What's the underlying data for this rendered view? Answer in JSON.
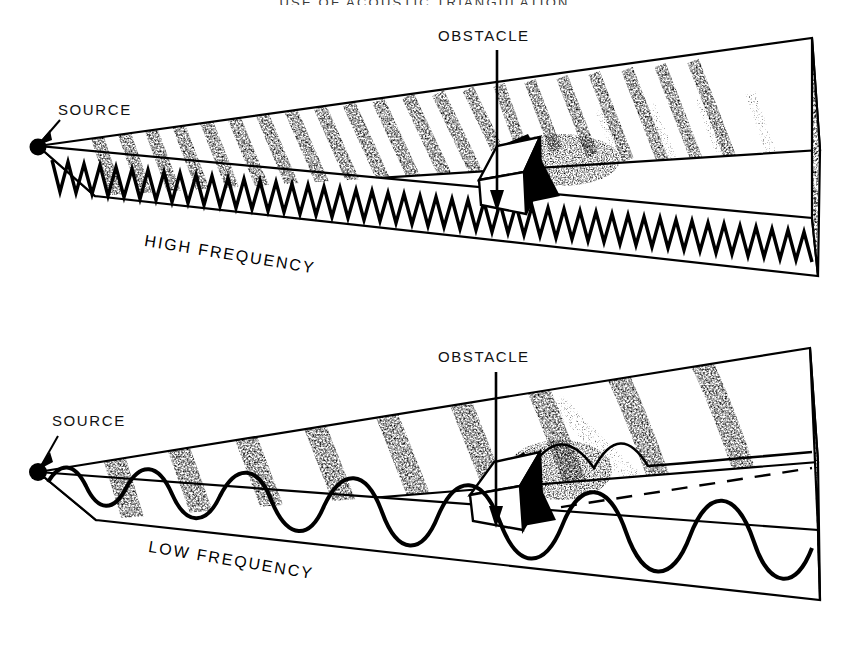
{
  "header": {
    "title": "USE OF ACOUSTIC TRIANGULATION"
  },
  "figure": {
    "kind": "wave-diffraction-diagram",
    "panels": [
      {
        "id": "high-frequency",
        "frequency_label": "HIGH FREQUENCY",
        "source_label": "SOURCE",
        "obstacle_label": "OBSTACLE",
        "wave_character": "short-wavelength, many closely spaced wavefront bands",
        "shadow": "sharp acoustic shadow behind obstacle, little bending",
        "front_face_wave": "tight triangular zigzag, constant small wavelength",
        "wavefront_count": 26
      },
      {
        "id": "low-frequency",
        "frequency_label": "LOW FREQUENCY",
        "source_label": "SOURCE",
        "obstacle_label": "OBSTACLE",
        "wave_character": "long-wavelength, few widely spaced wavefront bands",
        "shadow": "waves diffract and bend around obstacle, shadow filled in",
        "front_face_wave": "smooth sine wave, long wavelength",
        "wavefront_count": 8
      }
    ]
  },
  "colors": {
    "ink": "#000000",
    "paper": "#ffffff",
    "header_ink": "#3a3a3a"
  }
}
